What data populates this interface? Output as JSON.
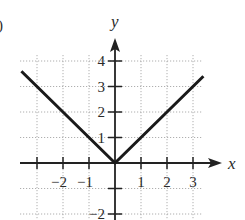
{
  "panel_marker": ")",
  "chart_data": {
    "type": "line",
    "title": "",
    "function": "y = |x|",
    "xlabel": "x",
    "ylabel": "y",
    "xlim": [
      -3.6,
      3.4
    ],
    "ylim": [
      -2,
      4
    ],
    "grid": true,
    "x_ticks": [
      -2,
      -1,
      1,
      2,
      3
    ],
    "y_ticks": [
      -2,
      -1,
      1,
      2,
      3,
      4
    ],
    "x_tick_labels": [
      "−2",
      "−1",
      "1",
      "2",
      "3"
    ],
    "y_tick_labels": [
      "−2",
      "1",
      "2",
      "3",
      "4"
    ],
    "series": [
      {
        "name": "y = |x|",
        "x": [
          -3.6,
          0,
          3.4
        ],
        "y": [
          3.6,
          0,
          3.4
        ]
      }
    ]
  }
}
